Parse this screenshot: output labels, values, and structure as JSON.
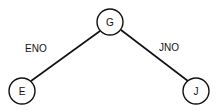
{
  "diagram": {
    "type": "tree",
    "nodes": [
      {
        "id": "G",
        "label": "G",
        "cx": 110,
        "cy": 22,
        "r": 13
      },
      {
        "id": "E",
        "label": "E",
        "cx": 22,
        "cy": 91,
        "r": 13
      },
      {
        "id": "J",
        "label": "J",
        "cx": 196,
        "cy": 91,
        "r": 13
      }
    ],
    "edges": [
      {
        "from": "G",
        "to": "E",
        "label": "ENO"
      },
      {
        "from": "G",
        "to": "J",
        "label": "JNO"
      }
    ]
  }
}
